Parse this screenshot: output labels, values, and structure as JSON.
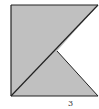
{
  "diagram": {
    "type": "geometry-figure",
    "shape": "square",
    "fill_color": "#c0c0c0",
    "cutout_color": "#ffffff",
    "stroke_color": "#222222",
    "square": {
      "x": 11,
      "y": 5,
      "width": 87,
      "height": 91
    },
    "diagonal": {
      "from": [
        11,
        96
      ],
      "to": [
        98,
        5
      ]
    },
    "inner_vertex": [
      57,
      51
    ],
    "cutout_triangle": [
      [
        98,
        5
      ],
      [
        57,
        51
      ],
      [
        98,
        96
      ]
    ],
    "labels": [
      {
        "text": "3",
        "x": 68,
        "y": 101
      }
    ]
  }
}
